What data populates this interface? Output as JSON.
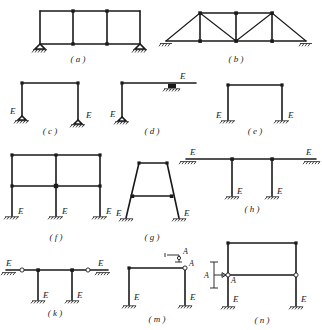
{
  "figure": {
    "stiffness_symbol": "E",
    "section_symbol": "A"
  },
  "panels": [
    {
      "id": "a",
      "caption": "( a )",
      "description": "Three-bay single-story rigid frame on two pinned supports",
      "supports": [
        "pin-left",
        "pin-right"
      ],
      "e_labels": [],
      "bays": 3,
      "stories": 1
    },
    {
      "id": "b",
      "caption": "( b )",
      "description": "Pratt-type planar truss with inclined end diagonals on two pinned supports",
      "supports": [
        "pin-left",
        "pin-right"
      ],
      "e_labels": [],
      "top_chord_panels": 2,
      "bottom_chord_panels": 4
    },
    {
      "id": "c",
      "caption": "( c )",
      "description": "Single-bay portal frame on two pinned supports",
      "supports": [
        "pin-left",
        "pin-right"
      ],
      "e_labels": [
        "E",
        "E"
      ],
      "bays": 1,
      "stories": 1
    },
    {
      "id": "d",
      "caption": "( d )",
      "description": "L-shaped bent, pinned at base and roller supported under the cantilever beam",
      "supports": [
        "pin-base",
        "roller-beam"
      ],
      "e_labels": [
        "E",
        "E"
      ],
      "bays": 1,
      "stories": 1
    },
    {
      "id": "e",
      "caption": "( e )",
      "description": "Single-bay portal frame on two fixed supports",
      "supports": [
        "fixed-left",
        "fixed-right"
      ],
      "e_labels": [
        "E",
        "E"
      ],
      "bays": 1,
      "stories": 1
    },
    {
      "id": "f",
      "caption": "( f )",
      "description": "Two-bay two-story rigid frame on three fixed supports",
      "supports": [
        "fixed-left",
        "fixed-middle",
        "fixed-right"
      ],
      "e_labels": [
        "E",
        "E",
        "E"
      ],
      "bays": 2,
      "stories": 2
    },
    {
      "id": "g",
      "caption": "( g )",
      "description": "Trapezoidal bent with inclined legs, one intermediate tie beam, two fixed bases",
      "supports": [
        "fixed-left",
        "fixed-right"
      ],
      "e_labels": [
        "E",
        "E"
      ],
      "bays": 1,
      "stories": 2
    },
    {
      "id": "h",
      "caption": "( h )",
      "description": "Continuous beam on two roller ends carried by two fixed-base columns",
      "supports": [
        "roller-left",
        "roller-right",
        "fixed-col-1",
        "fixed-col-2"
      ],
      "e_labels": [
        "E",
        "E",
        "E",
        "E"
      ],
      "bays": 3,
      "stories": 1
    },
    {
      "id": "k",
      "caption": "( k )",
      "description": "Same beam-and-column system as (h) but with internal hinges in the beam next to each roller",
      "supports": [
        "roller-left",
        "roller-right",
        "fixed-col-1",
        "fixed-col-2"
      ],
      "e_labels": [
        "E",
        "E",
        "E",
        "E"
      ],
      "hinges": 2
    },
    {
      "id": "m",
      "caption": "( m )",
      "description": "Portal frame with an internal hinge at the top right corner, two fixed supports, section marker A",
      "supports": [
        "fixed-left",
        "fixed-right"
      ],
      "e_labels": [
        "E",
        "E"
      ],
      "hinges": 1,
      "section_marks": [
        "A",
        "A"
      ]
    },
    {
      "id": "n",
      "caption": "( n )",
      "description": "Two-story portal frame with hinged mid-height tie beam, two fixed supports, section marker A",
      "supports": [
        "fixed-left",
        "fixed-right"
      ],
      "e_labels": [
        "E",
        "E"
      ],
      "hinges": 2,
      "section_marks": [
        "A"
      ]
    }
  ]
}
